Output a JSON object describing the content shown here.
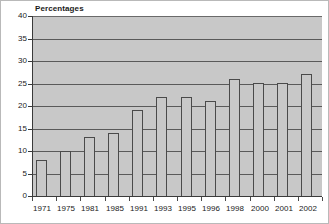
{
  "chart_data": {
    "type": "bar",
    "title": "Percentages",
    "xlabel": "",
    "ylabel": "",
    "ylim": [
      0,
      40
    ],
    "ytick_step": 5,
    "yticks": [
      0,
      5,
      10,
      15,
      20,
      25,
      30,
      35,
      40
    ],
    "ytick_labels": [
      "0",
      "5",
      "10",
      "15",
      "20",
      "25",
      "30",
      "35",
      "40"
    ],
    "grid": true,
    "legend": false,
    "categories": [
      "1971",
      "1975",
      "1981",
      "1985",
      "1991",
      "1993",
      "1995",
      "1996",
      "1998",
      "2000",
      "2001",
      "2002"
    ],
    "values": [
      8,
      10,
      13,
      14,
      19,
      22,
      22,
      21,
      26,
      25,
      25,
      27
    ],
    "colors": {
      "plot_background": "#c8c8c8",
      "bar_fill": "#c8c8c8",
      "bar_border": "#4a4a4a",
      "gridline": "#5a5a5a",
      "axis": "#3a3a3a",
      "text": "#1a1a1a",
      "page_background": "#ffffff",
      "frame_border": "#b9b9b9"
    }
  }
}
